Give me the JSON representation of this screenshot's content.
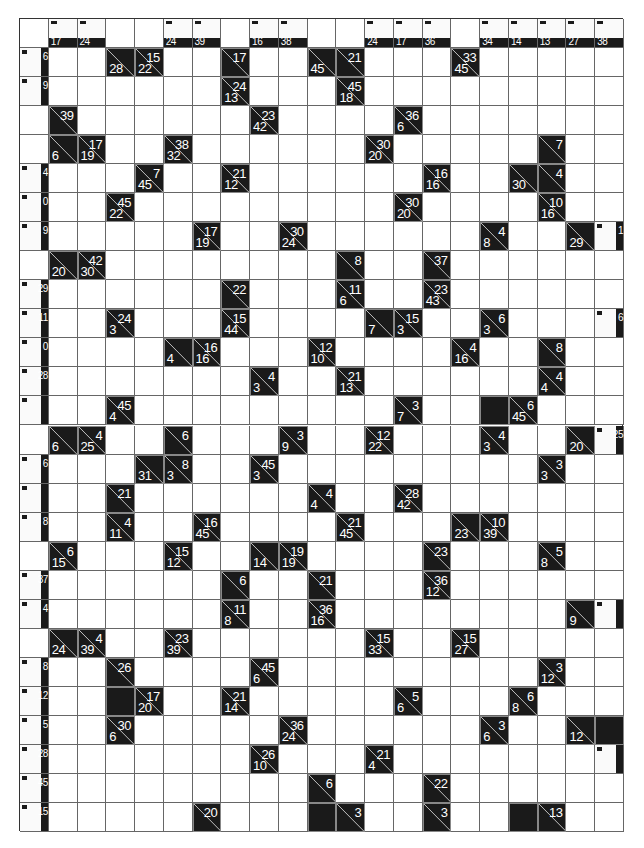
{
  "puzzle": {
    "type": "kakuro",
    "rows": 28,
    "cols": 21,
    "colors": {
      "clue_bg": "#1a1a1a",
      "cell_bg": "#ffffff",
      "grid_line": "#666666",
      "clue_text": "#ffffff"
    },
    "header_clues": [
      {
        "r": 0,
        "c": 1,
        "down": "17"
      },
      {
        "r": 0,
        "c": 2,
        "down": "24"
      },
      {
        "r": 0,
        "c": 5,
        "down": "24"
      },
      {
        "r": 0,
        "c": 6,
        "down": "39"
      },
      {
        "r": 0,
        "c": 8,
        "down": "16"
      },
      {
        "r": 0,
        "c": 9,
        "down": "38"
      },
      {
        "r": 0,
        "c": 12,
        "down": "24"
      },
      {
        "r": 0,
        "c": 13,
        "down": "17"
      },
      {
        "r": 0,
        "c": 14,
        "down": "36"
      },
      {
        "r": 0,
        "c": 16,
        "down": "34"
      },
      {
        "r": 0,
        "c": 17,
        "down": "14"
      },
      {
        "r": 0,
        "c": 18,
        "down": "13"
      },
      {
        "r": 0,
        "c": 19,
        "down": "27"
      },
      {
        "r": 0,
        "c": 20,
        "down": "38"
      }
    ],
    "left_clues": [
      {
        "r": 1,
        "c": 0,
        "right": "6"
      },
      {
        "r": 2,
        "c": 0,
        "right": "9"
      },
      {
        "r": 5,
        "c": 0,
        "right": "4"
      },
      {
        "r": 6,
        "c": 0,
        "right": "0"
      },
      {
        "r": 7,
        "c": 0,
        "right": "9"
      },
      {
        "r": 9,
        "c": 0,
        "right": "29"
      },
      {
        "r": 10,
        "c": 0,
        "right": "11"
      },
      {
        "r": 11,
        "c": 0,
        "right": "0"
      },
      {
        "r": 12,
        "c": 0,
        "right": "28"
      },
      {
        "r": 13,
        "c": 0,
        "right": ""
      },
      {
        "r": 15,
        "c": 0,
        "right": "6"
      },
      {
        "r": 16,
        "c": 0,
        "right": ""
      },
      {
        "r": 17,
        "c": 0,
        "right": "8"
      },
      {
        "r": 19,
        "c": 0,
        "right": "37"
      },
      {
        "r": 20,
        "c": 0,
        "right": "4"
      },
      {
        "r": 22,
        "c": 0,
        "right": "8"
      },
      {
        "r": 23,
        "c": 0,
        "right": "12"
      },
      {
        "r": 24,
        "c": 0,
        "right": "5"
      },
      {
        "r": 25,
        "c": 0,
        "right": "28"
      },
      {
        "r": 26,
        "c": 0,
        "right": "45"
      },
      {
        "r": 27,
        "c": 0,
        "right": "15"
      }
    ],
    "right_edge_partial": [
      {
        "r": 7,
        "c": 20,
        "down": "1"
      },
      {
        "r": 10,
        "c": 20,
        "down": "6"
      },
      {
        "r": 14,
        "c": 20,
        "down": "25"
      },
      {
        "r": 20,
        "c": 20,
        "down": ""
      },
      {
        "r": 25,
        "c": 20,
        "down": ""
      }
    ],
    "clues": [
      {
        "r": 1,
        "c": 3,
        "down": "28",
        "right": ""
      },
      {
        "r": 1,
        "c": 4,
        "down": "22",
        "right": "15"
      },
      {
        "r": 1,
        "c": 7,
        "down": "",
        "right": "17"
      },
      {
        "r": 1,
        "c": 10,
        "down": "45",
        "right": ""
      },
      {
        "r": 1,
        "c": 11,
        "down": "",
        "right": "21"
      },
      {
        "r": 1,
        "c": 15,
        "down": "45",
        "right": "33"
      },
      {
        "r": 2,
        "c": 7,
        "down": "13",
        "right": "24"
      },
      {
        "r": 2,
        "c": 11,
        "down": "18",
        "right": "45"
      },
      {
        "r": 3,
        "c": 1,
        "down": "",
        "right": "39"
      },
      {
        "r": 3,
        "c": 8,
        "down": "42",
        "right": "23"
      },
      {
        "r": 3,
        "c": 13,
        "down": "6",
        "right": "36"
      },
      {
        "r": 4,
        "c": 1,
        "down": "6",
        "right": ""
      },
      {
        "r": 4,
        "c": 2,
        "down": "19",
        "right": "17"
      },
      {
        "r": 4,
        "c": 5,
        "down": "32",
        "right": "38"
      },
      {
        "r": 4,
        "c": 12,
        "down": "20",
        "right": "30"
      },
      {
        "r": 4,
        "c": 18,
        "down": "",
        "right": "7"
      },
      {
        "r": 5,
        "c": 4,
        "down": "45",
        "right": "7"
      },
      {
        "r": 5,
        "c": 7,
        "down": "12",
        "right": "21"
      },
      {
        "r": 5,
        "c": 14,
        "down": "16",
        "right": "16"
      },
      {
        "r": 5,
        "c": 17,
        "down": "30",
        "right": ""
      },
      {
        "r": 5,
        "c": 18,
        "down": "",
        "right": "4"
      },
      {
        "r": 6,
        "c": 3,
        "down": "22",
        "right": "45"
      },
      {
        "r": 6,
        "c": 13,
        "down": "20",
        "right": "30"
      },
      {
        "r": 6,
        "c": 18,
        "down": "16",
        "right": "10"
      },
      {
        "r": 7,
        "c": 6,
        "down": "19",
        "right": "17"
      },
      {
        "r": 7,
        "c": 9,
        "down": "24",
        "right": "30"
      },
      {
        "r": 7,
        "c": 16,
        "down": "8",
        "right": "4"
      },
      {
        "r": 7,
        "c": 19,
        "down": "29",
        "right": ""
      },
      {
        "r": 8,
        "c": 1,
        "down": "20",
        "right": ""
      },
      {
        "r": 8,
        "c": 2,
        "down": "30",
        "right": "42"
      },
      {
        "r": 8,
        "c": 11,
        "down": "",
        "right": "8"
      },
      {
        "r": 8,
        "c": 14,
        "down": "",
        "right": "37"
      },
      {
        "r": 9,
        "c": 7,
        "down": "",
        "right": "22"
      },
      {
        "r": 9,
        "c": 11,
        "down": "6",
        "right": "11"
      },
      {
        "r": 9,
        "c": 14,
        "down": "43",
        "right": "23"
      },
      {
        "r": 10,
        "c": 3,
        "down": "3",
        "right": "24"
      },
      {
        "r": 10,
        "c": 7,
        "down": "44",
        "right": "15"
      },
      {
        "r": 10,
        "c": 12,
        "down": "7",
        "right": ""
      },
      {
        "r": 10,
        "c": 13,
        "down": "3",
        "right": "15"
      },
      {
        "r": 10,
        "c": 16,
        "down": "3",
        "right": "6"
      },
      {
        "r": 11,
        "c": 5,
        "down": "4",
        "right": ""
      },
      {
        "r": 11,
        "c": 6,
        "down": "16",
        "right": "16"
      },
      {
        "r": 11,
        "c": 10,
        "down": "10",
        "right": "12"
      },
      {
        "r": 11,
        "c": 15,
        "down": "16",
        "right": "4"
      },
      {
        "r": 11,
        "c": 18,
        "down": "",
        "right": "8"
      },
      {
        "r": 12,
        "c": 8,
        "down": "3",
        "right": "4"
      },
      {
        "r": 12,
        "c": 11,
        "down": "13",
        "right": "21"
      },
      {
        "r": 12,
        "c": 18,
        "down": "4",
        "right": "4"
      },
      {
        "r": 13,
        "c": 3,
        "down": "4",
        "right": "45"
      },
      {
        "r": 13,
        "c": 13,
        "down": "7",
        "right": "3"
      },
      {
        "r": 13,
        "c": 16,
        "down": "",
        "right": "",
        "solid": true
      },
      {
        "r": 13,
        "c": 17,
        "down": "45",
        "right": "6"
      },
      {
        "r": 14,
        "c": 1,
        "down": "6",
        "right": ""
      },
      {
        "r": 14,
        "c": 2,
        "down": "25",
        "right": "4"
      },
      {
        "r": 14,
        "c": 5,
        "down": "",
        "right": "6"
      },
      {
        "r": 14,
        "c": 9,
        "down": "9",
        "right": "3"
      },
      {
        "r": 14,
        "c": 12,
        "down": "22",
        "right": "12"
      },
      {
        "r": 14,
        "c": 16,
        "down": "3",
        "right": "4"
      },
      {
        "r": 14,
        "c": 19,
        "down": "20",
        "right": ""
      },
      {
        "r": 15,
        "c": 4,
        "down": "31",
        "right": ""
      },
      {
        "r": 15,
        "c": 5,
        "down": "3",
        "right": "8"
      },
      {
        "r": 15,
        "c": 8,
        "down": "3",
        "right": "45"
      },
      {
        "r": 15,
        "c": 18,
        "down": "3",
        "right": "3"
      },
      {
        "r": 16,
        "c": 3,
        "down": "",
        "right": "21"
      },
      {
        "r": 16,
        "c": 10,
        "down": "4",
        "right": "4"
      },
      {
        "r": 16,
        "c": 13,
        "down": "42",
        "right": "28"
      },
      {
        "r": 17,
        "c": 3,
        "down": "11",
        "right": "4"
      },
      {
        "r": 17,
        "c": 6,
        "down": "45",
        "right": "16"
      },
      {
        "r": 17,
        "c": 11,
        "down": "45",
        "right": "21"
      },
      {
        "r": 17,
        "c": 15,
        "down": "23",
        "right": ""
      },
      {
        "r": 17,
        "c": 16,
        "down": "39",
        "right": "10"
      },
      {
        "r": 18,
        "c": 1,
        "down": "15",
        "right": "6"
      },
      {
        "r": 18,
        "c": 5,
        "down": "12",
        "right": "15"
      },
      {
        "r": 18,
        "c": 8,
        "down": "14",
        "right": ""
      },
      {
        "r": 18,
        "c": 9,
        "down": "19",
        "right": "19"
      },
      {
        "r": 18,
        "c": 14,
        "down": "",
        "right": "23"
      },
      {
        "r": 18,
        "c": 18,
        "down": "8",
        "right": "5"
      },
      {
        "r": 19,
        "c": 7,
        "down": "",
        "right": "6"
      },
      {
        "r": 19,
        "c": 10,
        "down": "",
        "right": "21"
      },
      {
        "r": 19,
        "c": 14,
        "down": "12",
        "right": "36"
      },
      {
        "r": 20,
        "c": 7,
        "down": "8",
        "right": "11"
      },
      {
        "r": 20,
        "c": 10,
        "down": "16",
        "right": "36"
      },
      {
        "r": 20,
        "c": 19,
        "down": "9",
        "right": ""
      },
      {
        "r": 21,
        "c": 1,
        "down": "24",
        "right": ""
      },
      {
        "r": 21,
        "c": 2,
        "down": "39",
        "right": "4"
      },
      {
        "r": 21,
        "c": 5,
        "down": "39",
        "right": "23"
      },
      {
        "r": 21,
        "c": 12,
        "down": "33",
        "right": "15"
      },
      {
        "r": 21,
        "c": 15,
        "down": "27",
        "right": "15"
      },
      {
        "r": 22,
        "c": 3,
        "down": "",
        "right": "26"
      },
      {
        "r": 22,
        "c": 8,
        "down": "6",
        "right": "45"
      },
      {
        "r": 22,
        "c": 18,
        "down": "12",
        "right": "3"
      },
      {
        "r": 23,
        "c": 3,
        "down": "",
        "right": "",
        "solid": true
      },
      {
        "r": 23,
        "c": 4,
        "down": "20",
        "right": "17"
      },
      {
        "r": 23,
        "c": 7,
        "down": "14",
        "right": "21"
      },
      {
        "r": 23,
        "c": 13,
        "down": "6",
        "right": "5"
      },
      {
        "r": 23,
        "c": 17,
        "down": "8",
        "right": "6"
      },
      {
        "r": 24,
        "c": 3,
        "down": "6",
        "right": "30"
      },
      {
        "r": 24,
        "c": 9,
        "down": "24",
        "right": "36"
      },
      {
        "r": 24,
        "c": 16,
        "down": "6",
        "right": "3"
      },
      {
        "r": 24,
        "c": 19,
        "down": "12",
        "right": ""
      },
      {
        "r": 24,
        "c": 20,
        "down": "",
        "right": "",
        "solid": true
      },
      {
        "r": 25,
        "c": 8,
        "down": "10",
        "right": "26"
      },
      {
        "r": 25,
        "c": 12,
        "down": "4",
        "right": "21"
      },
      {
        "r": 26,
        "c": 10,
        "down": "",
        "right": "6"
      },
      {
        "r": 26,
        "c": 14,
        "down": "",
        "right": "22"
      },
      {
        "r": 27,
        "c": 6,
        "down": "",
        "right": "20"
      },
      {
        "r": 27,
        "c": 10,
        "down": "",
        "right": "",
        "solid": true
      },
      {
        "r": 27,
        "c": 11,
        "down": "",
        "right": "3"
      },
      {
        "r": 27,
        "c": 14,
        "down": "",
        "right": "3"
      },
      {
        "r": 27,
        "c": 17,
        "down": "",
        "right": "",
        "solid": true
      },
      {
        "r": 27,
        "c": 18,
        "down": "",
        "right": "13"
      }
    ]
  }
}
